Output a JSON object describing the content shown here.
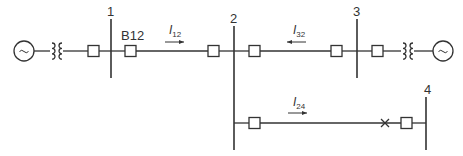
{
  "diagram": {
    "type": "single-line power system diagram",
    "line_color": "#333333",
    "buses": [
      {
        "id": "bus-1",
        "label": "1"
      },
      {
        "id": "bus-2",
        "label": "2"
      },
      {
        "id": "bus-3",
        "label": "3"
      },
      {
        "id": "bus-4",
        "label": "4"
      }
    ],
    "breaker_label": "B12",
    "currents": [
      {
        "id": "I12",
        "symbol": "I",
        "subscript": "12",
        "direction": "right"
      },
      {
        "id": "I32",
        "symbol": "I",
        "subscript": "32",
        "direction": "left"
      },
      {
        "id": "I24",
        "symbol": "I",
        "subscript": "24",
        "direction": "right"
      }
    ],
    "generators": [
      {
        "id": "gen-left",
        "symbol": "~"
      },
      {
        "id": "gen-right",
        "symbol": "~"
      }
    ],
    "fault_marker": "×"
  }
}
